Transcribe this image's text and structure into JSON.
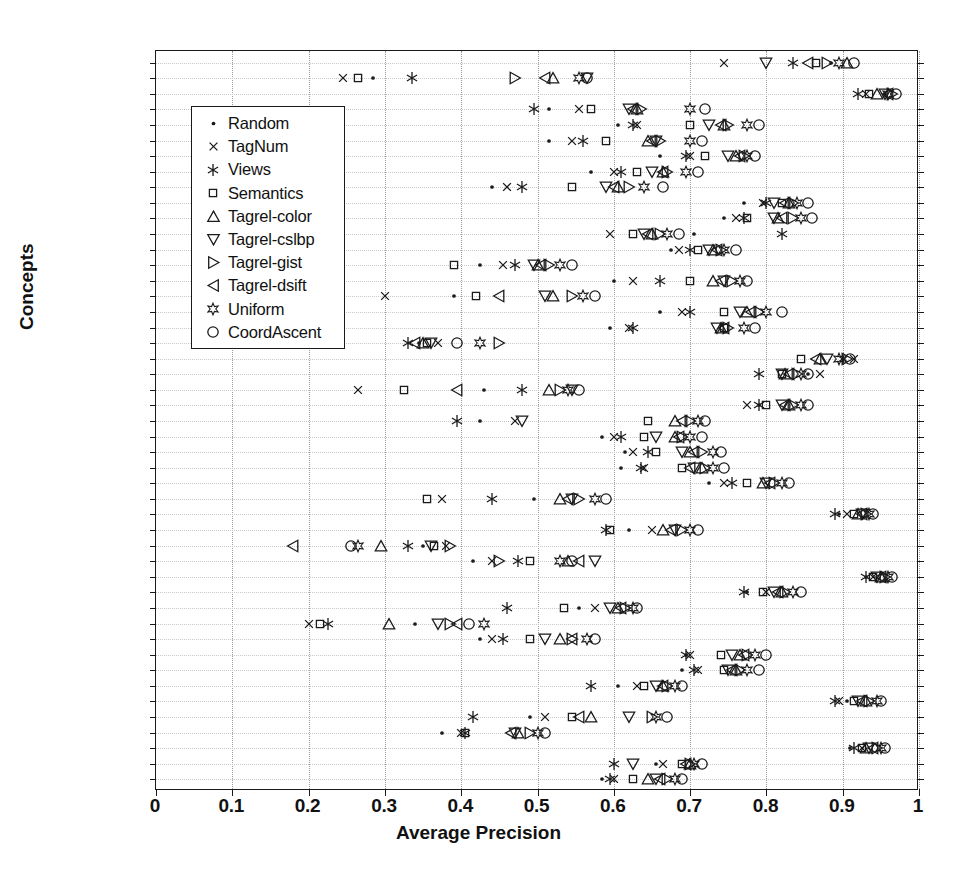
{
  "chart_data": {
    "type": "scatter",
    "title": "",
    "xlabel": "Average Precision",
    "ylabel": "Concepts",
    "xlim": [
      0,
      1
    ],
    "xticks": [
      "0",
      "0.1",
      "0.2",
      "0.3",
      "0.4",
      "0.5",
      "0.6",
      "0.7",
      "0.8",
      "0.9",
      "1"
    ],
    "xtick_values": [
      0,
      0.1,
      0.2,
      0.3,
      0.4,
      0.5,
      0.6,
      0.7,
      0.8,
      0.9,
      1
    ],
    "grid": "both-dotted",
    "legend_position": "upper-left-inside",
    "categories": [
      "airplane",
      "airport",
      "animal",
      "beach",
      "bird",
      "boat",
      "bridge",
      "building",
      "car",
      "cat",
      "cloud",
      "cow",
      "dog",
      "fire",
      "fish",
      "flag",
      "flower",
      "food",
      "garden",
      "grass",
      "horse",
      "house",
      "lake",
      "leaf",
      "mountain",
      "ocean",
      "person",
      "plant",
      "reflection",
      "road",
      "rock",
      "sand",
      "sign",
      "sky",
      "snow",
      "sport",
      "street",
      "sun",
      "sunset",
      "temple",
      "tower",
      "toy",
      "train",
      "tree",
      "water",
      "window",
      "MEAN"
    ],
    "series": [
      {
        "name": "Random",
        "marker": "dot",
        "values": [
          0.885,
          0.285,
          0.955,
          0.515,
          0.605,
          0.515,
          0.66,
          0.57,
          0.44,
          0.77,
          0.745,
          0.705,
          0.675,
          0.425,
          0.6,
          0.39,
          0.66,
          0.595,
          0.345,
          0.9,
          0.855,
          0.43,
          0.79,
          0.425,
          0.585,
          0.615,
          0.61,
          0.725,
          0.495,
          0.895,
          0.62,
          0.35,
          0.415,
          0.93,
          0.775,
          0.555,
          0.34,
          0.425,
          0.695,
          0.69,
          0.605,
          0.905,
          0.49,
          0.375,
          0.91,
          0.655,
          0.585
        ]
      },
      {
        "name": "TagNum",
        "marker": "x",
        "values": [
          0.745,
          0.245,
          0.93,
          0.555,
          0.63,
          0.545,
          0.7,
          0.6,
          0.46,
          0.795,
          0.76,
          0.595,
          0.685,
          0.455,
          0.625,
          0.3,
          0.69,
          0.62,
          0.37,
          0.915,
          0.87,
          0.265,
          0.775,
          0.47,
          0.6,
          0.625,
          0.64,
          0.745,
          0.375,
          0.905,
          0.65,
          0.38,
          0.44,
          0.94,
          0.8,
          0.575,
          0.2,
          0.44,
          0.7,
          0.71,
          0.63,
          0.895,
          0.51,
          0.4,
          0.925,
          0.665,
          0.6
        ]
      },
      {
        "name": "Views",
        "marker": "asterisk",
        "values": [
          0.835,
          0.335,
          0.92,
          0.495,
          0.625,
          0.56,
          0.695,
          0.61,
          0.48,
          0.8,
          0.77,
          0.82,
          0.7,
          0.47,
          0.66,
          0.22,
          0.7,
          0.625,
          0.33,
          0.9,
          0.79,
          0.48,
          0.79,
          0.395,
          0.61,
          0.645,
          0.635,
          0.755,
          0.44,
          0.89,
          0.59,
          0.33,
          0.475,
          0.93,
          0.77,
          0.46,
          0.225,
          0.455,
          0.695,
          0.705,
          0.57,
          0.89,
          0.415,
          0.405,
          0.915,
          0.6,
          0.595
        ]
      },
      {
        "name": "Semantics",
        "marker": "square",
        "values": [
          0.865,
          0.265,
          0.935,
          0.57,
          0.7,
          0.59,
          0.72,
          0.63,
          0.545,
          0.82,
          0.775,
          0.625,
          0.71,
          0.39,
          0.7,
          0.42,
          0.745,
          0.745,
          0.355,
          0.845,
          0.82,
          0.325,
          0.8,
          0.645,
          0.64,
          0.655,
          0.69,
          0.775,
          0.355,
          0.915,
          0.595,
          0.365,
          0.49,
          0.94,
          0.795,
          0.535,
          0.215,
          0.49,
          0.74,
          0.745,
          0.64,
          0.915,
          0.545,
          0.405,
          0.925,
          0.69,
          0.625
        ]
      },
      {
        "name": "Tagrel-color",
        "marker": "tri-up",
        "values": [
          0.905,
          0.52,
          0.945,
          0.63,
          0.745,
          0.645,
          0.76,
          0.665,
          0.605,
          0.83,
          0.815,
          0.65,
          0.73,
          0.5,
          0.73,
          0.52,
          0.775,
          0.74,
          0.35,
          0.87,
          0.825,
          0.515,
          0.83,
          0.68,
          0.68,
          0.7,
          0.715,
          0.795,
          0.53,
          0.92,
          0.665,
          0.295,
          0.54,
          0.95,
          0.82,
          0.605,
          0.305,
          0.53,
          0.765,
          0.76,
          0.665,
          0.93,
          0.57,
          0.475,
          0.93,
          0.7,
          0.645
        ]
      },
      {
        "name": "Tagrel-cslbp",
        "marker": "tri-down",
        "values": [
          0.8,
          0.565,
          0.955,
          0.62,
          0.725,
          0.655,
          0.75,
          0.65,
          0.59,
          0.81,
          0.81,
          0.64,
          0.725,
          0.495,
          0.745,
          0.51,
          0.765,
          0.735,
          0.36,
          0.88,
          0.82,
          0.545,
          0.82,
          0.48,
          0.655,
          0.69,
          0.705,
          0.8,
          0.545,
          0.925,
          0.68,
          0.36,
          0.575,
          0.945,
          0.81,
          0.595,
          0.37,
          0.51,
          0.755,
          0.75,
          0.655,
          0.92,
          0.62,
          0.47,
          0.935,
          0.625,
          0.655
        ]
      },
      {
        "name": "Tagrel-gist",
        "marker": "tri-right",
        "values": [
          0.88,
          0.47,
          0.965,
          0.635,
          0.75,
          0.66,
          0.77,
          0.67,
          0.62,
          0.835,
          0.835,
          0.66,
          0.74,
          0.515,
          0.755,
          0.545,
          0.79,
          0.75,
          0.45,
          0.905,
          0.84,
          0.53,
          0.835,
          0.7,
          0.69,
          0.715,
          0.72,
          0.81,
          0.555,
          0.93,
          0.69,
          0.385,
          0.45,
          0.955,
          0.825,
          0.615,
          0.385,
          0.545,
          0.775,
          0.765,
          0.67,
          0.935,
          0.65,
          0.49,
          0.945,
          0.7,
          0.67
        ]
      },
      {
        "name": "Tagrel-dsift",
        "marker": "tri-left",
        "values": [
          0.855,
          0.51,
          0.96,
          0.625,
          0.74,
          0.65,
          0.765,
          0.665,
          0.6,
          0.825,
          0.82,
          0.645,
          0.735,
          0.505,
          0.74,
          0.45,
          0.78,
          0.745,
          0.34,
          0.865,
          0.83,
          0.395,
          0.825,
          0.69,
          0.685,
          0.705,
          0.7,
          0.805,
          0.54,
          0.925,
          0.675,
          0.18,
          0.555,
          0.95,
          0.815,
          0.61,
          0.395,
          0.545,
          0.77,
          0.755,
          0.665,
          0.925,
          0.555,
          0.465,
          0.94,
          0.695,
          0.66
        ]
      },
      {
        "name": "Uniform",
        "marker": "star",
        "values": [
          0.895,
          0.555,
          0.96,
          0.7,
          0.775,
          0.7,
          0.775,
          0.695,
          0.64,
          0.84,
          0.845,
          0.67,
          0.745,
          0.53,
          0.765,
          0.56,
          0.8,
          0.77,
          0.425,
          0.895,
          0.845,
          0.54,
          0.845,
          0.71,
          0.7,
          0.73,
          0.73,
          0.82,
          0.575,
          0.935,
          0.7,
          0.265,
          0.53,
          0.96,
          0.835,
          0.625,
          0.43,
          0.565,
          0.785,
          0.775,
          0.68,
          0.945,
          0.655,
          0.5,
          0.95,
          0.705,
          0.68
        ]
      },
      {
        "name": "CoordAscent",
        "marker": "circle",
        "values": [
          0.915,
          0.565,
          0.97,
          0.72,
          0.79,
          0.715,
          0.785,
          0.71,
          0.665,
          0.855,
          0.86,
          0.685,
          0.76,
          0.545,
          0.775,
          0.575,
          0.82,
          0.785,
          0.395,
          0.91,
          0.855,
          0.555,
          0.855,
          0.72,
          0.715,
          0.74,
          0.745,
          0.83,
          0.59,
          0.94,
          0.71,
          0.255,
          0.545,
          0.965,
          0.845,
          0.63,
          0.41,
          0.575,
          0.8,
          0.79,
          0.69,
          0.95,
          0.67,
          0.51,
          0.955,
          0.715,
          0.69
        ]
      }
    ],
    "legend": [
      {
        "label": "Random",
        "marker": "dot"
      },
      {
        "label": "TagNum",
        "marker": "x"
      },
      {
        "label": "Views",
        "marker": "asterisk"
      },
      {
        "label": "Semantics",
        "marker": "square"
      },
      {
        "label": "Tagrel-color",
        "marker": "tri-up"
      },
      {
        "label": "Tagrel-cslbp",
        "marker": "tri-down"
      },
      {
        "label": "Tagrel-gist",
        "marker": "tri-right"
      },
      {
        "label": "Tagrel-dsift",
        "marker": "tri-left"
      },
      {
        "label": "Uniform",
        "marker": "star"
      },
      {
        "label": "CoordAscent",
        "marker": "circle"
      }
    ],
    "marker_color": "#1a1a1a"
  }
}
